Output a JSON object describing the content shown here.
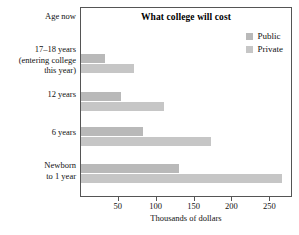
{
  "chart_data": {
    "type": "bar",
    "orientation": "horizontal",
    "title": "What college will cost",
    "xlabel": "Thousands of dollars",
    "ylabel": "Age now",
    "categories": [
      "17–18 years\n(entering college\nthis year)",
      "12 years",
      "6 years",
      "Newborn\nto 1 year"
    ],
    "series": [
      {
        "name": "Public",
        "values": [
          32,
          53,
          82,
          130
        ],
        "color": "#b9b9b9"
      },
      {
        "name": "Private",
        "values": [
          70,
          110,
          172,
          265
        ],
        "color": "#c6c6c6"
      }
    ],
    "xticks": [
      50,
      100,
      150,
      200,
      250
    ],
    "xtick_labels": [
      "50",
      "100",
      "150",
      "200",
      "250"
    ],
    "xlim": [
      0,
      280
    ],
    "grid": false,
    "legend_position": "upper-right",
    "frame": true
  },
  "legend": {
    "entries": [
      {
        "label": "Public"
      },
      {
        "label": "Private"
      }
    ]
  },
  "axis": {
    "category_header": "Age now",
    "x_axis_title": "Thousands of dollars"
  },
  "colors": {
    "public": "#b9b9b9",
    "private": "#c6c6c6",
    "frame": "#555555",
    "text": "#111111",
    "background": "#ffffff"
  }
}
